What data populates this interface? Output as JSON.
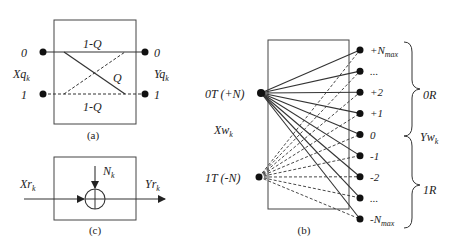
{
  "panel_a": {
    "caption": "(a)",
    "input_label": "Xq",
    "input_sub": "k",
    "output_label": "Yq",
    "output_sub": "k",
    "left_ports": [
      "0",
      "1"
    ],
    "right_ports": [
      "0",
      "1"
    ],
    "edges": [
      {
        "from": "0",
        "to": "0",
        "label": "1-Q",
        "style": "solid"
      },
      {
        "from": "0",
        "to": "1",
        "label": "Q",
        "style": "solid"
      },
      {
        "from": "1",
        "to": "0",
        "label": "",
        "style": "dashed"
      },
      {
        "from": "1",
        "to": "1",
        "label": "1-Q",
        "style": "dashed"
      }
    ]
  },
  "panel_b": {
    "caption": "(b)",
    "input_label": "Xw",
    "input_sub": "k",
    "output_label": "Yw",
    "output_sub": "k",
    "left_ports": [
      "0T (+N)",
      "1T (-N)"
    ],
    "right_ports": [
      {
        "main": "+N",
        "sub": "max"
      },
      {
        "main": "...",
        "sub": ""
      },
      {
        "main": "+2",
        "sub": ""
      },
      {
        "main": "+1",
        "sub": ""
      },
      {
        "main": "0",
        "sub": ""
      },
      {
        "main": "-1",
        "sub": ""
      },
      {
        "main": "-2",
        "sub": ""
      },
      {
        "main": "...",
        "sub": ""
      },
      {
        "main": "-N",
        "sub": "max"
      }
    ],
    "group_upper": "0R",
    "group_lower": "1R",
    "edge_styles": {
      "0T": "solid",
      "1T": "dashed"
    }
  },
  "panel_c": {
    "caption": "(c)",
    "input_label": "Xr",
    "input_sub": "k",
    "output_label": "Yr",
    "output_sub": "k",
    "noise_label": "N",
    "noise_sub": "k",
    "operator": "adder"
  },
  "colors": {
    "stroke": "#333333",
    "background": "#ffffff"
  }
}
